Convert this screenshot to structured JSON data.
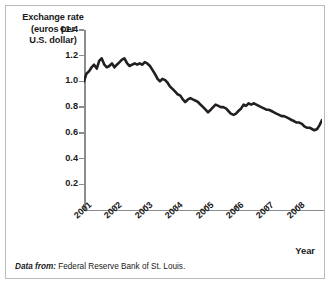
{
  "figure": {
    "y_axis_title": "Exchange rate (euros per U.S. dollar)",
    "y_axis_title_lines": [
      "Exchange rate",
      "(euros per",
      "U.S. dollar)"
    ],
    "x_axis_title": "Year",
    "source_prefix": "Data from:",
    "source_text": "Federal Reserve Bank of St. Louis.",
    "frame_color": "#b9bcbe",
    "axis_color": "#8a8d8f",
    "line_color": "#231f20",
    "background": "#ffffff"
  },
  "chart_data": {
    "type": "line",
    "title": "",
    "xlabel": "Year",
    "ylabel": "Exchange rate (euros per U.S. dollar)",
    "xlim": [
      2001.0,
      2008.83
    ],
    "ylim": [
      0.0,
      1.4
    ],
    "grid": false,
    "legend": null,
    "ytick_labels": [
      "€1.4",
      "1.2",
      "1.0",
      "0.8",
      "0.6",
      "0.4",
      "0.2"
    ],
    "ytick_values": [
      1.4,
      1.2,
      1.0,
      0.8,
      0.6,
      0.4,
      0.2
    ],
    "xtick_labels": [
      "2001",
      "2002",
      "2003",
      "2004",
      "2005",
      "2006",
      "2007",
      "2008"
    ],
    "xtick_values": [
      2001,
      2002,
      2003,
      2004,
      2005,
      2006,
      2007,
      2008
    ],
    "series": [
      {
        "name": "Euros per U.S. dollar",
        "x": [
          2001.0,
          2001.08,
          2001.17,
          2001.25,
          2001.33,
          2001.42,
          2001.5,
          2001.58,
          2001.67,
          2001.75,
          2001.83,
          2001.92,
          2002.0,
          2002.08,
          2002.17,
          2002.25,
          2002.33,
          2002.42,
          2002.5,
          2002.58,
          2002.67,
          2002.75,
          2002.83,
          2002.92,
          2003.0,
          2003.08,
          2003.17,
          2003.25,
          2003.33,
          2003.42,
          2003.5,
          2003.58,
          2003.67,
          2003.75,
          2003.83,
          2003.92,
          2004.0,
          2004.08,
          2004.17,
          2004.25,
          2004.33,
          2004.42,
          2004.5,
          2004.58,
          2004.67,
          2004.75,
          2004.83,
          2004.92,
          2005.0,
          2005.08,
          2005.17,
          2005.25,
          2005.33,
          2005.42,
          2005.5,
          2005.58,
          2005.67,
          2005.75,
          2005.83,
          2005.92,
          2006.0,
          2006.08,
          2006.17,
          2006.25,
          2006.33,
          2006.42,
          2006.5,
          2006.58,
          2006.67,
          2006.75,
          2006.83,
          2006.92,
          2007.0,
          2007.08,
          2007.17,
          2007.25,
          2007.33,
          2007.42,
          2007.5,
          2007.58,
          2007.67,
          2007.75,
          2007.83,
          2007.92,
          2008.0,
          2008.08,
          2008.17,
          2008.25,
          2008.33,
          2008.42,
          2008.5,
          2008.58,
          2008.67,
          2008.75,
          2008.83
        ],
        "values": [
          1.0,
          1.06,
          1.08,
          1.11,
          1.13,
          1.1,
          1.16,
          1.18,
          1.13,
          1.11,
          1.12,
          1.14,
          1.11,
          1.13,
          1.15,
          1.17,
          1.18,
          1.14,
          1.12,
          1.13,
          1.14,
          1.13,
          1.14,
          1.13,
          1.15,
          1.14,
          1.12,
          1.09,
          1.06,
          1.02,
          1.0,
          1.02,
          1.01,
          0.99,
          0.96,
          0.94,
          0.92,
          0.9,
          0.89,
          0.86,
          0.84,
          0.86,
          0.87,
          0.86,
          0.85,
          0.84,
          0.82,
          0.8,
          0.78,
          0.76,
          0.78,
          0.8,
          0.82,
          0.81,
          0.8,
          0.8,
          0.79,
          0.77,
          0.75,
          0.74,
          0.75,
          0.77,
          0.79,
          0.82,
          0.81,
          0.83,
          0.82,
          0.83,
          0.82,
          0.81,
          0.8,
          0.79,
          0.78,
          0.78,
          0.77,
          0.76,
          0.75,
          0.74,
          0.73,
          0.73,
          0.72,
          0.71,
          0.7,
          0.69,
          0.68,
          0.68,
          0.67,
          0.65,
          0.64,
          0.64,
          0.63,
          0.62,
          0.63,
          0.66,
          0.7
        ]
      }
    ]
  }
}
